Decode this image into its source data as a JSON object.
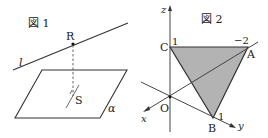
{
  "figure1": {
    "title": "図 1",
    "line_label": "l",
    "point_R": "R",
    "point_S": "S",
    "plane_label": "α"
  },
  "figure2": {
    "title": "図 2",
    "axis_x": "x",
    "axis_y": "y",
    "axis_z": "z",
    "origin": "O",
    "point_A": "A",
    "point_B": "B",
    "point_C": "C",
    "tick_C": "1",
    "tick_A": "−2",
    "tick_B": "1",
    "fill_color": "#b3b3b3",
    "stroke_color": "#333333"
  }
}
